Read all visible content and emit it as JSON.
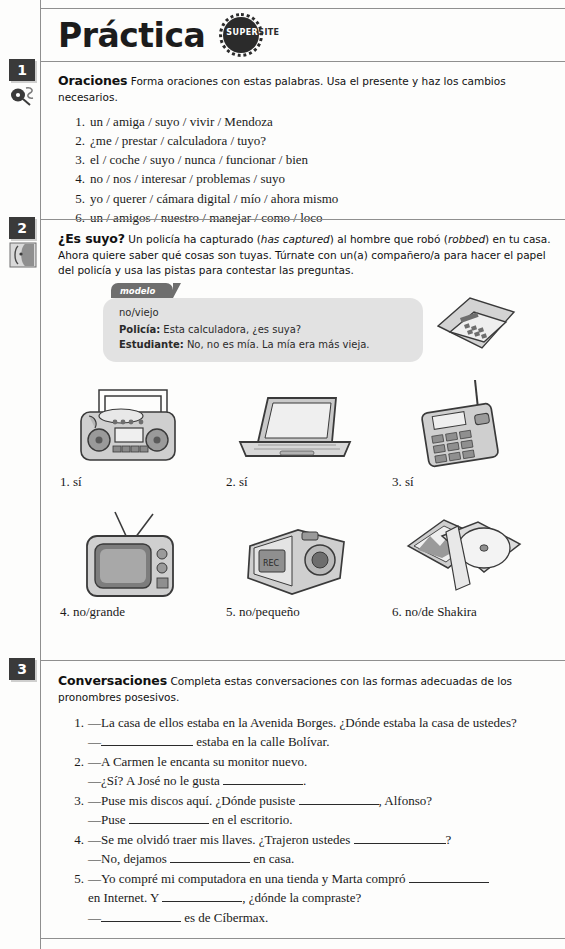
{
  "header": {
    "title": "Práctica",
    "supersite_super": "SUPER",
    "supersite_site": "SITE"
  },
  "activities": [
    {
      "number": "1",
      "icon": "mouse-pen-icon",
      "title": "Oraciones",
      "instructions": "Forma oraciones con estas palabras. Usa el presente y haz los cambios necesarios.",
      "items": [
        "un / amiga / suyo / vivir / Mendoza",
        "¿me / prestar / calculadora / tuyo?",
        "el / coche / suyo / nunca / funcionar / bien",
        "no / nos / interesar / problemas / suyo",
        "yo / querer / cámara digital / mío / ahora mismo",
        "un / amigos / nuestro / manejar / como / loco"
      ]
    },
    {
      "number": "2",
      "icon": "pair-work-icon",
      "title": "¿Es suyo?",
      "instructions_a": "Un policía ha capturado (",
      "instructions_italic1": "has captured",
      "instructions_b": ") al hombre que robó (",
      "instructions_italic2": "robbed",
      "instructions_c": ") en tu casa. Ahora quiere saber qué cosas son tuyas. Túrnate con un(a) compañero/a para hacer el papel del policía y usa las pistas para contestar las preguntas.",
      "modelo": {
        "tab_label": "modelo",
        "cue": "no/viejo",
        "speaker1": "Policía:",
        "line1": "Esta calculadora, ¿es suya?",
        "speaker2": "Estudiante:",
        "line2": "No, no es mía. La mía era más vieja."
      },
      "pictures": [
        {
          "caption": "1. sí",
          "art": "boombox-illustration"
        },
        {
          "caption": "2. sí",
          "art": "laptop-illustration"
        },
        {
          "caption": "3. sí",
          "art": "cordless-phone-illustration"
        },
        {
          "caption": "4. no/grande",
          "art": "television-illustration"
        },
        {
          "caption": "5. no/pequeño",
          "art": "video-camera-illustration"
        },
        {
          "caption": "6. no/de Shakira",
          "art": "cd-cases-illustration"
        }
      ],
      "modelo_art": "calculator-illustration"
    },
    {
      "number": "3",
      "title": "Conversaciones",
      "instructions": "Completa estas conversaciones con las formas adecuadas de los pronombres posesivos.",
      "conversations": [
        {
          "line1_pre": "—La casa de ellos estaba en la Avenida Borges. ¿Dónde estaba la casa de ustedes?",
          "line2_pre": "—",
          "line2_post": " estaba en la calle Bolívar."
        },
        {
          "line1_pre": "—A Carmen le encanta su monitor nuevo.",
          "line2_pre": "—¿Sí? A José no le gusta ",
          "line2_post": "."
        },
        {
          "line1_pre": "—Puse mis discos aquí. ¿Dónde pusiste ",
          "line1_post": ", Alfonso?",
          "line2_pre": "—Puse ",
          "line2_post": " en el escritorio."
        },
        {
          "line1_pre": "—Se me olvidó traer mis llaves. ¿Trajeron ustedes ",
          "line1_post": "?",
          "line2_pre": "—No, dejamos ",
          "line2_post": " en casa."
        },
        {
          "line1_pre": "—Yo compré mi computadora en una tienda y Marta compró ",
          "line1_post": "",
          "line1b_pre": "en Internet. Y ",
          "line1b_post": ", ¿dónde la compraste?",
          "line2_pre": "—",
          "line2_post": " es de Cíbermax."
        }
      ]
    }
  ],
  "colors": {
    "badge": "#3a3a3a",
    "modelo_tab": "#6e6e6e",
    "modelo_box": "#e2e2e2",
    "rule": "#8f8f8f"
  }
}
